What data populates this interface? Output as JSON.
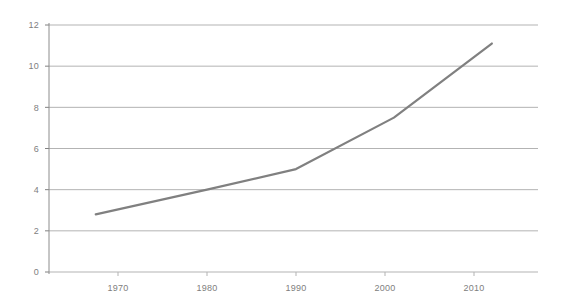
{
  "chart_data": {
    "type": "line",
    "title": "",
    "subtitle": "",
    "xlabel": "",
    "ylabel": "",
    "xlim": [
      1962.5,
      1917.5
    ],
    "ylim": [
      0,
      12
    ],
    "grid": true,
    "legend": false,
    "legend_position": "none",
    "x_tick_labels": [
      "1970",
      "1980",
      "1990",
      "2000",
      "2010"
    ],
    "x_ticks": [
      1970,
      1980,
      1990,
      2000,
      2010
    ],
    "y_tick_labels": [
      "0",
      "2",
      "4",
      "6",
      "8",
      "10",
      "12"
    ],
    "y_ticks": [
      0,
      2,
      4,
      6,
      8,
      10,
      12
    ],
    "series": [
      {
        "name": "series-1",
        "color": "#808080",
        "x": [
          1967.5,
          1980,
          1990,
          2001,
          2012
        ],
        "values": [
          2.8,
          4.0,
          5.0,
          7.5,
          11.1
        ]
      }
    ],
    "colors": {
      "line": "#808080",
      "grid": "#b3b3b3",
      "axis": "#808080",
      "tick_text": "#808080",
      "background": "#ffffff"
    }
  },
  "axes": {
    "y_axis_name": "y-axis",
    "x_axis_name": "x-axis"
  }
}
